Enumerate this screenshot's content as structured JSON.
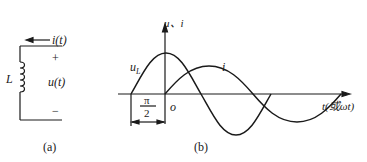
{
  "figure_a": {
    "caption": "(a)",
    "element_label": "L",
    "current_label": "i(t)",
    "voltage_label": "u(t)",
    "plus_sign": "+",
    "minus_sign": "−"
  },
  "figure_b": {
    "caption": "(b)",
    "y_axis_label": "u、i",
    "x_axis_label": "t(或ωt)",
    "origin_label": "o",
    "curve_voltage_label": "u",
    "curve_voltage_subscript": "L",
    "curve_current_label": "i",
    "phase_numerator": "π",
    "phase_denominator": "2"
  }
}
